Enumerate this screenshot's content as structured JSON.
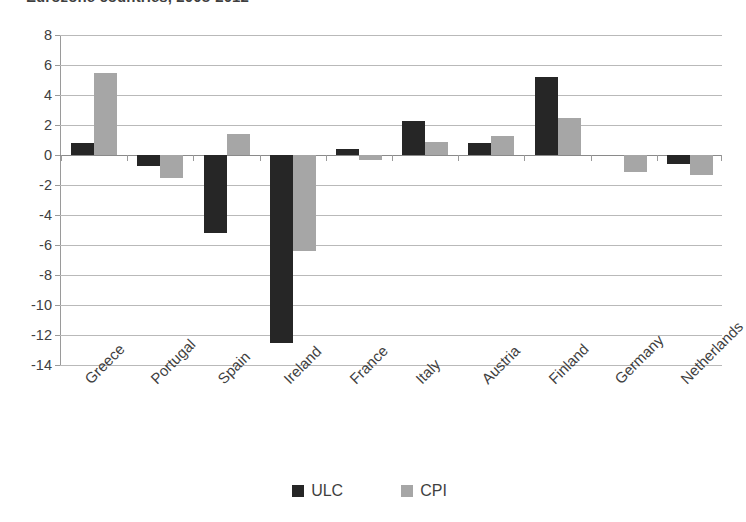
{
  "chart_data": {
    "type": "bar",
    "title": "Eurozone countries, 2008-2012",
    "xlabel": "",
    "ylabel": "",
    "ylim": [
      -14,
      8
    ],
    "ytick_step": 2,
    "yticks": [
      "8",
      "6",
      "4",
      "2",
      "0",
      "-2",
      "-4",
      "-6",
      "-8",
      "-10",
      "-12",
      "-14"
    ],
    "grid": true,
    "legend_position": "bottom-center",
    "categories": [
      "Greece",
      "Portugal",
      "Spain",
      "Ireland",
      "France",
      "Italy",
      "Austria",
      "Finland",
      "Germany",
      "Netherlands"
    ],
    "series": [
      {
        "name": "ULC",
        "color": "#262626",
        "values": [
          0.8,
          -0.7,
          -5.2,
          -12.5,
          0.4,
          2.3,
          0.8,
          5.2,
          0.0,
          -0.6
        ]
      },
      {
        "name": "CPI",
        "color": "#a6a6a6",
        "values": [
          5.5,
          -1.5,
          1.4,
          -6.4,
          -0.3,
          0.9,
          1.3,
          2.5,
          -1.1,
          -1.3
        ]
      }
    ]
  },
  "legend": {
    "items": [
      {
        "label": "ULC",
        "color": "#262626"
      },
      {
        "label": "CPI",
        "color": "#a6a6a6"
      }
    ]
  },
  "axis": {
    "grid_color": "#b9b9b9",
    "axis_color": "#9a9a9a"
  }
}
